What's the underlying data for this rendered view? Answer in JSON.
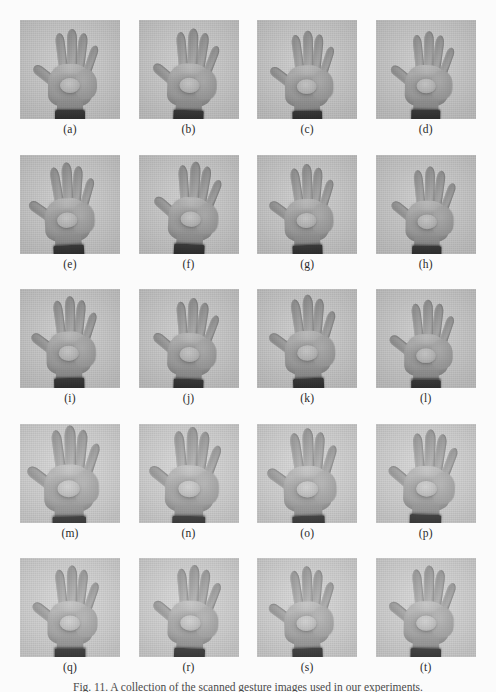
{
  "figure": {
    "caption": "Fig. 11. A collection of the scanned gesture images used in our experiments.",
    "background_color": "#fbfbfb",
    "panel_background_color": "#c9c9c9",
    "label_color": "#2a2a2a",
    "columns": 4,
    "rows": 5,
    "panel_count": 20
  },
  "panels": [
    {
      "label": "(a)",
      "variant": "a",
      "row": 1,
      "col": 1,
      "subject": "open-hand-gesture"
    },
    {
      "label": "(b)",
      "variant": "b",
      "row": 1,
      "col": 2,
      "subject": "open-hand-gesture"
    },
    {
      "label": "(c)",
      "variant": "c",
      "row": 1,
      "col": 3,
      "subject": "open-hand-gesture"
    },
    {
      "label": "(d)",
      "variant": "d",
      "row": 1,
      "col": 4,
      "subject": "open-hand-gesture"
    },
    {
      "label": "(e)",
      "variant": "e",
      "row": 2,
      "col": 1,
      "subject": "open-hand-gesture"
    },
    {
      "label": "(f)",
      "variant": "f",
      "row": 2,
      "col": 2,
      "subject": "open-hand-gesture"
    },
    {
      "label": "(g)",
      "variant": "g",
      "row": 2,
      "col": 3,
      "subject": "open-hand-gesture"
    },
    {
      "label": "(h)",
      "variant": "h",
      "row": 2,
      "col": 4,
      "subject": "open-hand-gesture"
    },
    {
      "label": "(i)",
      "variant": "i",
      "row": 3,
      "col": 1,
      "subject": "open-hand-gesture"
    },
    {
      "label": "(j)",
      "variant": "j",
      "row": 3,
      "col": 2,
      "subject": "open-hand-gesture"
    },
    {
      "label": "(k)",
      "variant": "k",
      "row": 3,
      "col": 3,
      "subject": "open-hand-gesture"
    },
    {
      "label": "(l)",
      "variant": "l",
      "row": 3,
      "col": 4,
      "subject": "open-hand-gesture"
    },
    {
      "label": "(m)",
      "variant": "m",
      "row": 4,
      "col": 1,
      "subject": "open-hand-gesture"
    },
    {
      "label": "(n)",
      "variant": "n",
      "row": 4,
      "col": 2,
      "subject": "open-hand-gesture"
    },
    {
      "label": "(o)",
      "variant": "o",
      "row": 4,
      "col": 3,
      "subject": "open-hand-gesture"
    },
    {
      "label": "(p)",
      "variant": "p",
      "row": 4,
      "col": 4,
      "subject": "open-hand-gesture"
    },
    {
      "label": "(q)",
      "variant": "q",
      "row": 5,
      "col": 1,
      "subject": "open-hand-gesture"
    },
    {
      "label": "(r)",
      "variant": "r",
      "row": 5,
      "col": 2,
      "subject": "open-hand-gesture"
    },
    {
      "label": "(s)",
      "variant": "s",
      "row": 5,
      "col": 3,
      "subject": "open-hand-gesture"
    },
    {
      "label": "(t)",
      "variant": "t",
      "row": 5,
      "col": 4,
      "subject": "open-hand-gesture"
    }
  ]
}
